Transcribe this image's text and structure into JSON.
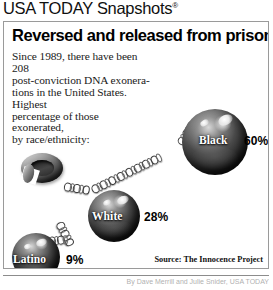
{
  "brand": {
    "name": "USA TODAY Snapshots",
    "trademark": "®"
  },
  "headline": "Reversed and released from prison",
  "deck": [
    "Since 1989, there have been 208",
    "post-conviction DNA exonera-",
    "tions in the United States. Highest",
    "percentage of those exonerated,",
    "by race/ethnicity:"
  ],
  "source": "Source: The Innocence Project",
  "byline": "By Dave Merrill and Julie Snider, USA TODAY",
  "colors": {
    "frame_border": "#9a9a9a",
    "text": "#000000",
    "label_on_ball": "#ffffff",
    "ball_dark": "#0a0a0a",
    "ball_highlight": "#f2f2f2"
  },
  "chart_data": {
    "type": "bar",
    "title": "Reversed and released from prison",
    "subtitle": "Since 1989, there have been 208 post-conviction DNA exonerations in the United States. Highest percentage of those exonerated, by race/ethnicity:",
    "xlabel": "",
    "ylabel": "Percentage of exonerated",
    "categories": [
      "Black",
      "White",
      "Latino"
    ],
    "values": [
      60,
      28,
      9
    ],
    "value_labels": [
      "60%",
      "28%",
      "9%"
    ],
    "unit": "%",
    "ylim": [
      0,
      100
    ],
    "grid": false,
    "legend": false,
    "total_exonerations": 208,
    "since_year": 1989,
    "source": "The Innocence Project",
    "encoding": "ball-and-chain pictograph; ball diameter scales with percentage"
  },
  "items": [
    {
      "name": "Black",
      "value": "60%",
      "pct": 60
    },
    {
      "name": "White",
      "value": "28%",
      "pct": 28
    },
    {
      "name": "Latino",
      "value": "9%",
      "pct": 9
    }
  ]
}
